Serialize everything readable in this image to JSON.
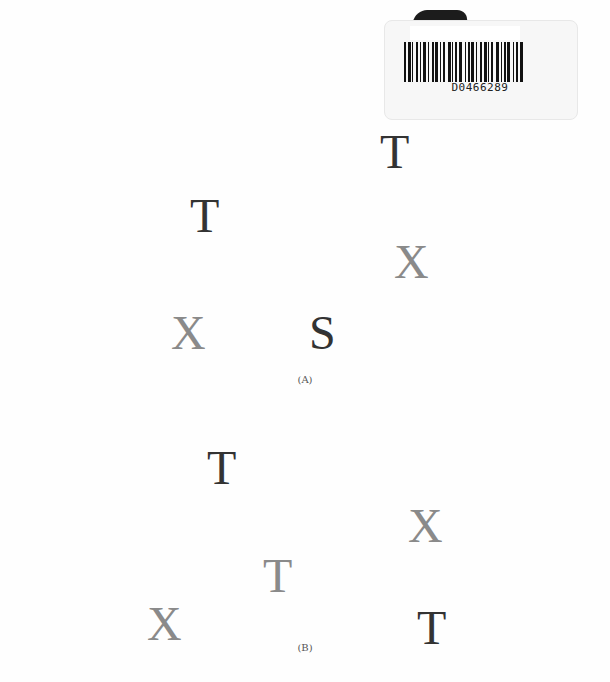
{
  "barcode": {
    "number": "D0466289"
  },
  "figure_a": {
    "caption": "(A)",
    "items": [
      {
        "letter": "T",
        "shade": "dark"
      },
      {
        "letter": "T",
        "shade": "dark"
      },
      {
        "letter": "X",
        "shade": "gray"
      },
      {
        "letter": "X",
        "shade": "gray"
      },
      {
        "letter": "S",
        "shade": "dark"
      }
    ]
  },
  "figure_b": {
    "caption": "(B)",
    "items": [
      {
        "letter": "T",
        "shade": "dark"
      },
      {
        "letter": "X",
        "shade": "gray"
      },
      {
        "letter": "T",
        "shade": "gray"
      },
      {
        "letter": "X",
        "shade": "gray"
      },
      {
        "letter": "T",
        "shade": "dark"
      }
    ]
  },
  "colors": {
    "dark": "#333333",
    "gray": "#8a8a8a"
  }
}
